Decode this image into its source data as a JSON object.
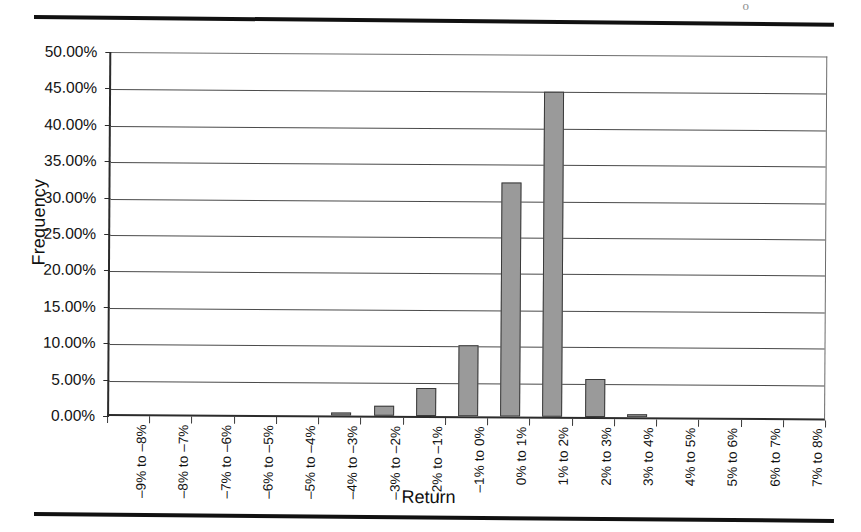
{
  "page": {
    "corner_mark": "o",
    "top_rule": true,
    "bottom_rule": true
  },
  "chart_data": {
    "type": "bar",
    "title": "",
    "xlabel": "Return",
    "ylabel": "Frequency",
    "ylim": [
      0,
      50
    ],
    "ytick_labels": [
      "0.00%",
      "5.00%",
      "10.00%",
      "15.00%",
      "20.00%",
      "25.00%",
      "30.00%",
      "35.00%",
      "40.00%",
      "45.00%",
      "50.00%"
    ],
    "ytick_values": [
      0,
      5,
      10,
      15,
      20,
      25,
      30,
      35,
      40,
      45,
      50
    ],
    "grid": true,
    "legend": "none",
    "categories": [
      "–9% to –8%",
      "–8% to –7%",
      "–7% to –6%",
      "–6% to –5%",
      "–5% to –4%",
      "–4% to –3%",
      "–3% to –2%",
      "–2% to –1%",
      "–1% to 0%",
      "0% to 1%",
      "1% to 2%",
      "2% to 3%",
      "3% to 4%",
      "4% to 5%",
      "5% to 6%",
      "6% to 7%",
      "7% to 8%"
    ],
    "values": [
      0,
      0,
      0,
      0,
      0,
      0.3,
      1.4,
      3.9,
      9.8,
      32.1,
      44.7,
      5.2,
      0.35,
      0,
      0,
      0,
      0
    ],
    "value_unit": "%",
    "bar_fill": "#9a9a9a",
    "bar_stroke": "#3a3a3a"
  }
}
